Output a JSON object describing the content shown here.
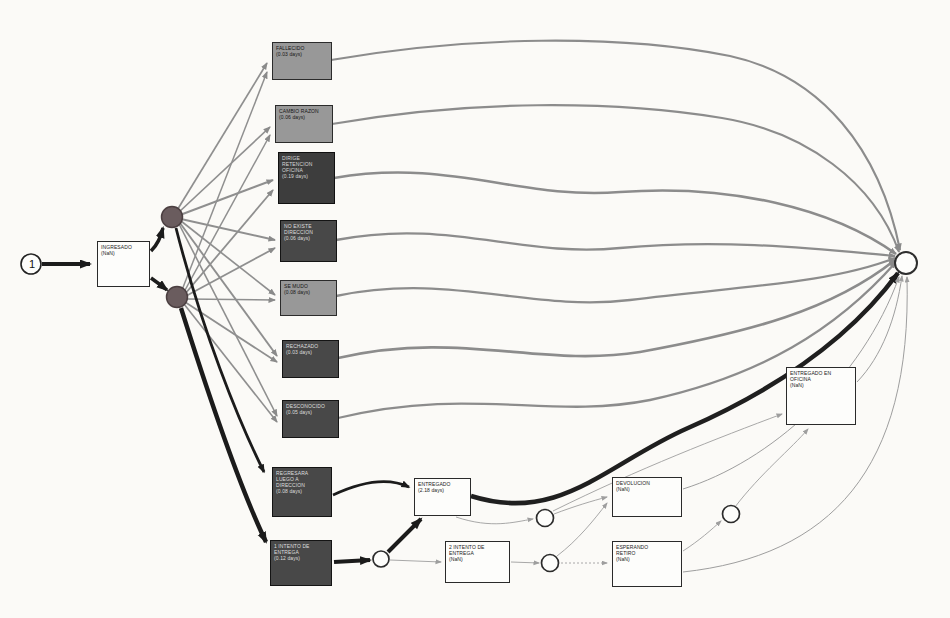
{
  "diagram": {
    "type": "process-model-scan",
    "start": {
      "label": "1"
    },
    "nodes": {
      "ingresado": {
        "lines": [
          "INGRESADO",
          "(NaN)"
        ]
      },
      "fallecido": {
        "lines": [
          "FALLECIDO",
          "(0.03 days)"
        ]
      },
      "cambio_razon": {
        "lines": [
          "CAMBIO RAZON",
          "(0.06 days)"
        ]
      },
      "dirige_retencion_oficina": {
        "lines": [
          "DIRIGE",
          "RETENCION",
          "OFICINA",
          "(0.19 days)"
        ]
      },
      "no_existe_direccion": {
        "lines": [
          "NO EXISTE",
          "DIRECCION",
          "(0.06 days)"
        ]
      },
      "se_mudo": {
        "lines": [
          "SE MUDO",
          "(0.08 days)"
        ]
      },
      "rechazado": {
        "lines": [
          "RECHAZADO",
          "(0.03 days)"
        ]
      },
      "desconocido": {
        "lines": [
          "DESCONOCIDO",
          "(0.05 days)"
        ]
      },
      "regresara_luego_a_direccion": {
        "lines": [
          "REGRESARA",
          "LUEGO A",
          "DIRECCION",
          "(0.08 days)"
        ]
      },
      "intento1": {
        "lines": [
          "1 INTENTO DE",
          "ENTREGA",
          "(0.12 days)"
        ]
      },
      "entregado": {
        "lines": [
          "ENTREGADO",
          "(2.18 days)"
        ]
      },
      "intento2": {
        "lines": [
          "2 INTENTO DE",
          "ENTREGA",
          "(NaN)"
        ]
      },
      "devolucion": {
        "lines": [
          "DEVOLUCION",
          "(NaN)"
        ]
      },
      "esperando_retiro": {
        "lines": [
          "ESPERANDO",
          "RETIRO",
          "(NaN)"
        ]
      },
      "entregado_en_oficina": {
        "lines": [
          "ENTREGADO EN",
          "OFICINA",
          "(NaN)"
        ]
      }
    },
    "colors": {
      "paper": "#fbfaf7",
      "dark_box": "#484848",
      "medium_box": "#989898",
      "white_box": "#fdfdfb",
      "junction_dot": "#6a5c5e",
      "edge_gray": "#8a8a8a",
      "edge_light": "#9e9e9e",
      "edge_black": "#1c1c1c"
    },
    "edges": [
      {
        "from": "start",
        "to": "ingresado",
        "weight": "thick"
      },
      {
        "from": "ingresado",
        "to": "junction-1",
        "weight": "thick"
      },
      {
        "from": "ingresado",
        "to": "junction-2",
        "weight": "thick"
      },
      {
        "from": "junction-1",
        "to": "fallecido"
      },
      {
        "from": "junction-1",
        "to": "cambio_razon"
      },
      {
        "from": "junction-1",
        "to": "dirige_retencion_oficina"
      },
      {
        "from": "junction-1",
        "to": "no_existe_direccion"
      },
      {
        "from": "junction-1",
        "to": "se_mudo"
      },
      {
        "from": "junction-1",
        "to": "rechazado"
      },
      {
        "from": "junction-1",
        "to": "desconocido"
      },
      {
        "from": "junction-1",
        "to": "regresara_luego_a_direccion",
        "weight": "thick"
      },
      {
        "from": "junction-2",
        "to": "fallecido"
      },
      {
        "from": "junction-2",
        "to": "cambio_razon"
      },
      {
        "from": "junction-2",
        "to": "dirige_retencion_oficina"
      },
      {
        "from": "junction-2",
        "to": "no_existe_direccion"
      },
      {
        "from": "junction-2",
        "to": "se_mudo"
      },
      {
        "from": "junction-2",
        "to": "rechazado"
      },
      {
        "from": "junction-2",
        "to": "desconocido"
      },
      {
        "from": "junction-2",
        "to": "intento1",
        "weight": "thick"
      },
      {
        "from": "fallecido",
        "to": "end"
      },
      {
        "from": "cambio_razon",
        "to": "end"
      },
      {
        "from": "dirige_retencion_oficina",
        "to": "end"
      },
      {
        "from": "no_existe_direccion",
        "to": "end"
      },
      {
        "from": "se_mudo",
        "to": "end"
      },
      {
        "from": "rechazado",
        "to": "end"
      },
      {
        "from": "desconocido",
        "to": "end"
      },
      {
        "from": "regresara_luego_a_direccion",
        "to": "entregado",
        "weight": "thick"
      },
      {
        "from": "intento1",
        "to": "circle-1",
        "weight": "thick"
      },
      {
        "from": "circle-1",
        "to": "entregado",
        "weight": "thick"
      },
      {
        "from": "circle-1",
        "to": "intento2"
      },
      {
        "from": "entregado",
        "to": "end",
        "weight": "thick"
      },
      {
        "from": "entregado",
        "to": "circle-2"
      },
      {
        "from": "intento2",
        "to": "circle-3"
      },
      {
        "from": "circle-3",
        "to": "devolucion"
      },
      {
        "from": "circle-3",
        "to": "esperando_retiro"
      },
      {
        "from": "circle-2",
        "to": "devolucion"
      },
      {
        "from": "circle-2",
        "to": "entregado_en_oficina"
      },
      {
        "from": "esperando_retiro",
        "to": "circle-4"
      },
      {
        "from": "circle-4",
        "to": "entregado_en_oficina"
      },
      {
        "from": "devolucion",
        "to": "end"
      },
      {
        "from": "esperando_retiro",
        "to": "end"
      },
      {
        "from": "entregado_en_oficina",
        "to": "end"
      }
    ]
  }
}
